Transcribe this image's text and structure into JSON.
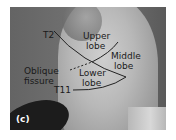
{
  "figure": {
    "panel_label": "(c)",
    "labels": {
      "t2": "T2",
      "upper_lobe_line1": "Upper",
      "upper_lobe_line2": "lobe",
      "middle_lobe_line1": "Middle",
      "middle_lobe_line2": "lobe",
      "oblique_line1": "Oblique",
      "oblique_line2": "fissure",
      "lower_lobe_line1": "Lower",
      "lower_lobe_line2": "lobe",
      "t11": "T11"
    }
  }
}
